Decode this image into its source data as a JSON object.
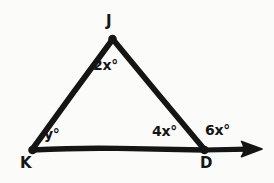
{
  "diagram": {
    "kind": "geometry-figure",
    "ink_color": "#151515",
    "background_color": "#fbfbfa",
    "vertices": [
      {
        "id": "J",
        "label": "J",
        "x": 112,
        "y": 38
      },
      {
        "id": "K",
        "label": "K",
        "x": 32,
        "y": 150
      },
      {
        "id": "D",
        "label": "D",
        "x": 204,
        "y": 150
      }
    ],
    "segments": [
      {
        "name": "side-KJ",
        "from": "K",
        "to": "J"
      },
      {
        "name": "side-JD",
        "from": "J",
        "to": "D"
      },
      {
        "name": "side-KD",
        "from": "K",
        "to": "D"
      }
    ],
    "ray": {
      "name": "ray-beyond-D",
      "from": "D",
      "tip_x": 262,
      "tip_y": 149,
      "has_arrowhead": true
    },
    "angles": [
      {
        "name": "angle-at-J",
        "label": "2x°",
        "vertex": "J"
      },
      {
        "name": "angle-at-K",
        "label": "y°",
        "vertex": "K"
      },
      {
        "name": "angle-at-D-interior",
        "label": "4x°",
        "vertex": "D"
      },
      {
        "name": "angle-at-D-exterior",
        "label": "6x°",
        "vertex": "D"
      }
    ]
  }
}
